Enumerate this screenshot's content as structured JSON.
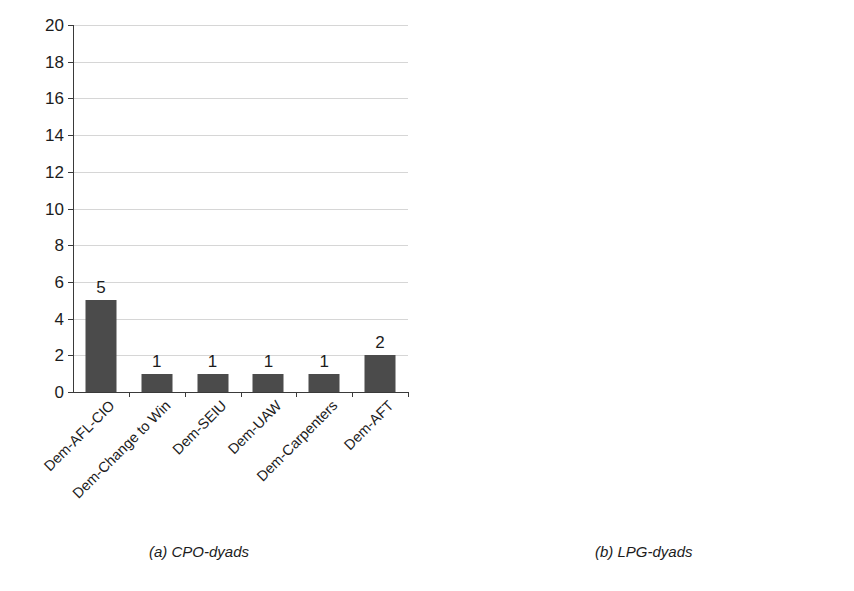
{
  "chart_data": [
    {
      "type": "bar",
      "panel": "a",
      "caption": "(a) CPO-dyads",
      "title": "",
      "xlabel": "",
      "ylabel": "",
      "ylim": [
        0,
        20
      ],
      "ytick_step": 2,
      "yticks": [
        0,
        2,
        4,
        6,
        8,
        10,
        12,
        14,
        16,
        18,
        20
      ],
      "grid": true,
      "legend": "none",
      "bar_color": "#4b4b4b",
      "categories": [
        "Dem-AFL-CIO",
        "Dem-Change to Win",
        "Dem-SEIU",
        "Dem-UAW",
        "Dem-Carpenters",
        "Dem-AFT"
      ],
      "values": [
        5,
        1,
        1,
        1,
        1,
        2
      ],
      "data_labels": [
        "5",
        "1",
        "1",
        "1",
        "1",
        "2"
      ]
    },
    {
      "type": "bar",
      "panel": "b",
      "caption": "(b) LPG-dyads",
      "title": "",
      "xlabel": "",
      "ylabel": "",
      "ylim": [
        0,
        20
      ],
      "ytick_step": 2,
      "yticks": [
        0,
        2,
        4,
        6,
        8,
        10,
        12,
        14,
        16,
        18,
        20
      ],
      "grid": true,
      "legend": "none",
      "bar_color": "#9a9a9a",
      "categories": [
        "Dem-AFL-CIO",
        "Dem-Change to Win",
        "Dem-SEIU",
        "Dem-UAW",
        "Dem-Carpenters",
        "Dem-AFT"
      ],
      "values": [
        3,
        1,
        1,
        2,
        2,
        2
      ],
      "data_labels": [
        "3",
        "1",
        "1",
        "2",
        "2",
        "2"
      ]
    }
  ],
  "colors": {
    "background": "#ffffff",
    "gridline": "#d6d6d6",
    "axis": "#3a3a3a",
    "text": "#1c1c1c",
    "bar_dark": "#4b4b4b",
    "bar_light": "#9a9a9a"
  }
}
